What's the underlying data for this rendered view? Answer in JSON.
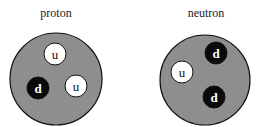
{
  "colors": {
    "nucleon_fill": "#8e8e8e",
    "nucleon_stroke": "#111111",
    "up_fill": "#ffffff",
    "down_fill": "#0a0a0a"
  },
  "particles": [
    {
      "label": "proton",
      "quarks": [
        {
          "flavor": "u",
          "type": "up"
        },
        {
          "flavor": "d",
          "type": "down"
        },
        {
          "flavor": "u",
          "type": "up"
        }
      ]
    },
    {
      "label": "neutron",
      "quarks": [
        {
          "flavor": "d",
          "type": "down"
        },
        {
          "flavor": "u",
          "type": "up"
        },
        {
          "flavor": "d",
          "type": "down"
        }
      ]
    }
  ]
}
